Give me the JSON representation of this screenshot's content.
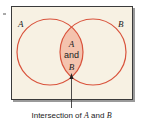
{
  "diagram": {
    "type": "venn",
    "sets": [
      {
        "label": "A"
      },
      {
        "label": "B"
      }
    ],
    "intersection": {
      "label_top": "A",
      "label_mid": "and",
      "label_bottom": "B"
    },
    "caption": {
      "prefix": "Intersection of ",
      "set_a": "A",
      "middle": " and ",
      "set_b": "B"
    },
    "colors": {
      "background": "#f7f1e3",
      "circle_stroke": "#d9533c",
      "intersection_fill": "#f4c3ae",
      "frame": "#3a3a3a"
    }
  }
}
